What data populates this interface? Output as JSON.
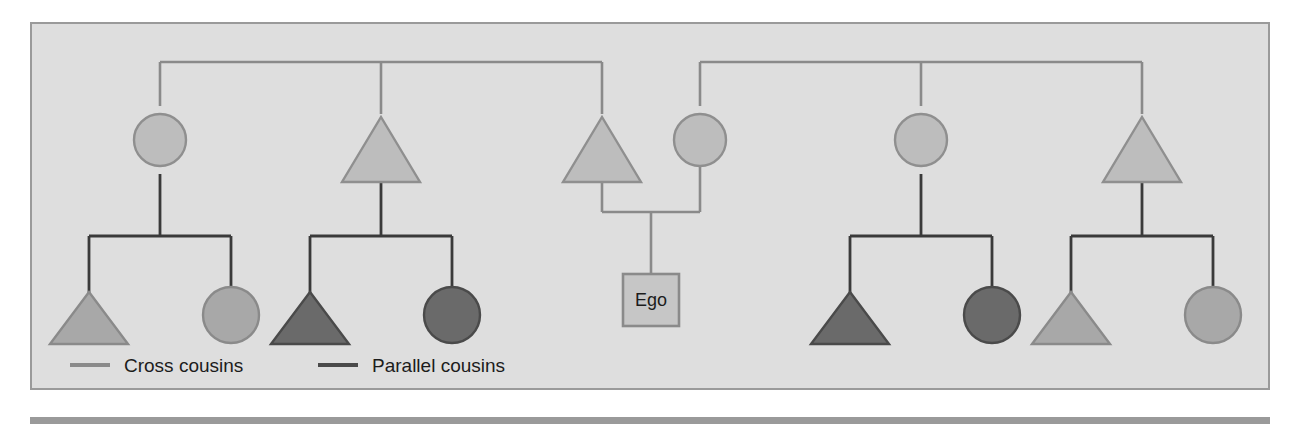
{
  "figure": {
    "type": "kinship-diagram",
    "panel_background": "#dedede",
    "panel_border_color": "#9a9a9a",
    "bottom_rule_color": "#9a9a9a"
  },
  "colors": {
    "cross_cousin_fill": "#a8a8a8",
    "cross_cousin_stroke": "#8a8a8a",
    "parallel_cousin_fill": "#6a6a6a",
    "parallel_cousin_stroke": "#4a4a4a",
    "parent_fill": "#bdbdbd",
    "parent_stroke": "#8f8f8f",
    "upper_link_color": "#8a8a8a",
    "sibling_link_color": "#3a3a3a",
    "ego_box_fill": "#c6c6c6",
    "ego_box_stroke": "#8a8a8a",
    "text_color": "#1c1c1c"
  },
  "ego": {
    "label": "Ego",
    "shape": "square"
  },
  "legend": {
    "items": [
      {
        "key": "cross",
        "label": "Cross cousins",
        "swatch_color": "#8a8a8a",
        "swatch_shape": "line"
      },
      {
        "key": "parallel",
        "label": "Parallel cousins",
        "swatch_color": "#4a4a4a",
        "swatch_shape": "line"
      }
    ]
  },
  "generations": {
    "parent_row": [
      {
        "id": "p1",
        "shape": "circle",
        "role": "fathers-sister",
        "relation_to_ego": "aunt",
        "cousin_type": "cross",
        "fill": "#bdbdbd"
      },
      {
        "id": "p2",
        "shape": "triangle",
        "role": "fathers-brother",
        "relation_to_ego": "uncle",
        "cousin_type": "parallel",
        "fill": "#bdbdbd"
      },
      {
        "id": "p3",
        "shape": "triangle",
        "role": "father",
        "relation_to_ego": "father",
        "cousin_type": "none",
        "fill": "#bdbdbd"
      },
      {
        "id": "p4",
        "shape": "circle",
        "role": "mother",
        "relation_to_ego": "mother",
        "cousin_type": "none",
        "fill": "#bdbdbd"
      },
      {
        "id": "p5",
        "shape": "circle",
        "role": "mothers-sister",
        "relation_to_ego": "aunt",
        "cousin_type": "parallel",
        "fill": "#bdbdbd"
      },
      {
        "id": "p6",
        "shape": "triangle",
        "role": "mothers-brother",
        "relation_to_ego": "uncle",
        "cousin_type": "cross",
        "fill": "#bdbdbd"
      }
    ],
    "cousin_row": [
      {
        "id": "c1",
        "shape": "triangle",
        "parent": "p1",
        "cousin_type": "cross",
        "fill": "#a8a8a8"
      },
      {
        "id": "c2",
        "shape": "circle",
        "parent": "p1",
        "cousin_type": "cross",
        "fill": "#a8a8a8"
      },
      {
        "id": "c3",
        "shape": "triangle",
        "parent": "p2",
        "cousin_type": "parallel",
        "fill": "#6a6a6a"
      },
      {
        "id": "c4",
        "shape": "circle",
        "parent": "p2",
        "cousin_type": "parallel",
        "fill": "#6a6a6a"
      },
      {
        "id": "c5",
        "shape": "triangle",
        "parent": "p5",
        "cousin_type": "parallel",
        "fill": "#6a6a6a"
      },
      {
        "id": "c6",
        "shape": "circle",
        "parent": "p5",
        "cousin_type": "parallel",
        "fill": "#6a6a6a"
      },
      {
        "id": "c7",
        "shape": "triangle",
        "parent": "p6",
        "cousin_type": "cross",
        "fill": "#a8a8a8"
      },
      {
        "id": "c8",
        "shape": "circle",
        "parent": "p6",
        "cousin_type": "cross",
        "fill": "#a8a8a8"
      }
    ]
  }
}
